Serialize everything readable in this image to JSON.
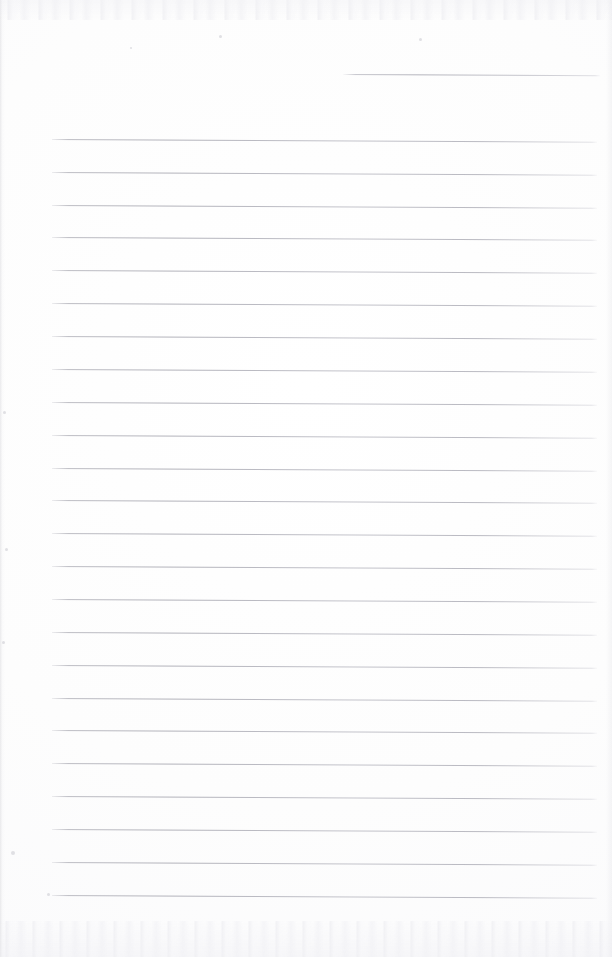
{
  "document": {
    "kind": "scanned-lined-notepad-page",
    "title": "Blank Ruled Notepad Page",
    "page_width": 612,
    "page_height": 957,
    "background_color": "#fdfdfd",
    "rule_color": "#b6b6be",
    "text_content": "",
    "visible_text": [],
    "is_blank": true
  },
  "layout": {
    "rule_left_x": 52,
    "rule_right_x": 597,
    "rule_thickness": 1,
    "rule_spacing": 32.8,
    "skew_degrees": 0.28,
    "first_full_rule_y": 139,
    "rule_count": 24
  },
  "top_rule": {
    "name": "header-rule",
    "start_x": 343,
    "end_x": 600,
    "y": 74,
    "width": 257
  },
  "rules": [
    {
      "index": 1,
      "y": 139
    },
    {
      "index": 2,
      "y": 172
    },
    {
      "index": 3,
      "y": 205
    },
    {
      "index": 4,
      "y": 237
    },
    {
      "index": 5,
      "y": 270
    },
    {
      "index": 6,
      "y": 303
    },
    {
      "index": 7,
      "y": 336
    },
    {
      "index": 8,
      "y": 369
    },
    {
      "index": 9,
      "y": 402
    },
    {
      "index": 10,
      "y": 435
    },
    {
      "index": 11,
      "y": 468
    },
    {
      "index": 12,
      "y": 500
    },
    {
      "index": 13,
      "y": 533
    },
    {
      "index": 14,
      "y": 566
    },
    {
      "index": 15,
      "y": 599
    },
    {
      "index": 16,
      "y": 632
    },
    {
      "index": 17,
      "y": 665
    },
    {
      "index": 18,
      "y": 698
    },
    {
      "index": 19,
      "y": 730
    },
    {
      "index": 20,
      "y": 763
    },
    {
      "index": 21,
      "y": 796
    },
    {
      "index": 22,
      "y": 829
    },
    {
      "index": 23,
      "y": 862
    },
    {
      "index": 24,
      "y": 895
    }
  ],
  "artifacts": {
    "top_noise_band": {
      "y": 0,
      "height": 20
    },
    "bottom_noise_band": {
      "y": 921,
      "height": 36
    },
    "specks": [
      {
        "x": 11,
        "y": 851,
        "size": 4
      },
      {
        "x": 47,
        "y": 893,
        "size": 3
      },
      {
        "x": 219,
        "y": 35,
        "size": 3
      },
      {
        "x": 419,
        "y": 38,
        "size": 3
      },
      {
        "x": 130,
        "y": 47,
        "size": 2
      },
      {
        "x": 3,
        "y": 411,
        "size": 3
      },
      {
        "x": 5,
        "y": 548,
        "size": 3
      },
      {
        "x": 2,
        "y": 641,
        "size": 3
      }
    ]
  }
}
